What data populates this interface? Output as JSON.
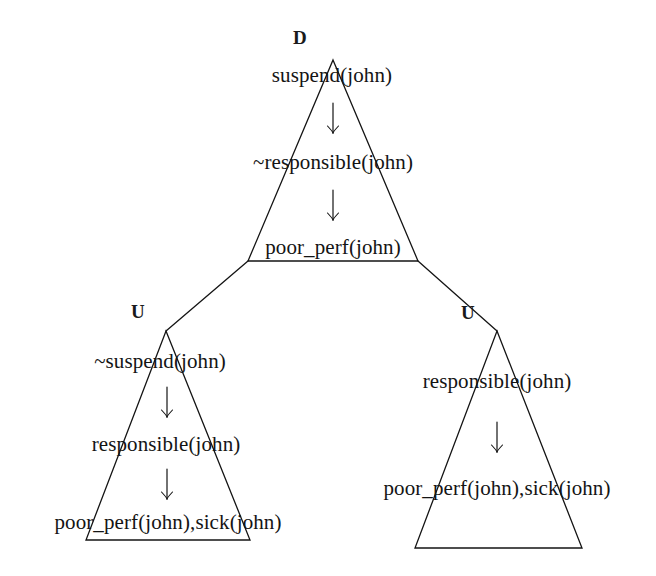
{
  "figure": {
    "kind": "argument-tree-diagram",
    "background_color": "#ffffff",
    "ink_color": "#141414",
    "width": 656,
    "height": 576
  },
  "triangles": [
    {
      "id": "root",
      "label": "D",
      "label_x": 300,
      "label_y": 38,
      "apex_x": 333,
      "apex_y": 60,
      "base_left_x": 248,
      "base_right_x": 418,
      "base_y": 261,
      "lines": [
        {
          "text": "suspend(john)",
          "x": 332,
          "y": 75
        },
        {
          "text": "~responsible(john)",
          "x": 333,
          "y": 162
        },
        {
          "text": "poor_perf(john)",
          "x": 333,
          "y": 247
        }
      ],
      "arrows": [
        {
          "x": 333,
          "y": 118
        },
        {
          "x": 333,
          "y": 205
        }
      ]
    },
    {
      "id": "left-undercutter",
      "label": "U",
      "label_x": 138,
      "label_y": 312,
      "apex_x": 166,
      "apex_y": 331,
      "base_left_x": 86,
      "base_right_x": 250,
      "base_y": 540,
      "lines": [
        {
          "text": "~suspend(john)",
          "x": 160,
          "y": 361
        },
        {
          "text": "responsible(john)",
          "x": 166,
          "y": 444
        },
        {
          "text": "poor_perf(john),sick(john)",
          "x": 168,
          "y": 522
        }
      ],
      "arrows": [
        {
          "x": 167,
          "y": 402
        },
        {
          "x": 167,
          "y": 484
        }
      ]
    },
    {
      "id": "right-undercutter",
      "label": "U",
      "label_x": 468,
      "label_y": 313,
      "apex_x": 497,
      "apex_y": 331,
      "base_left_x": 415,
      "base_right_x": 582,
      "base_y": 548,
      "lines": [
        {
          "text": "responsible(john)",
          "x": 497,
          "y": 381
        },
        {
          "text": "poor_perf(john),sick(john)",
          "x": 497,
          "y": 488
        }
      ],
      "arrows": [
        {
          "x": 497,
          "y": 437
        }
      ]
    }
  ],
  "branches": [
    {
      "id": "root-to-left",
      "x1": 248,
      "y1": 261,
      "x2": 166,
      "y2": 331
    },
    {
      "id": "root-to-right",
      "x1": 418,
      "y1": 261,
      "x2": 497,
      "y2": 331
    }
  ]
}
